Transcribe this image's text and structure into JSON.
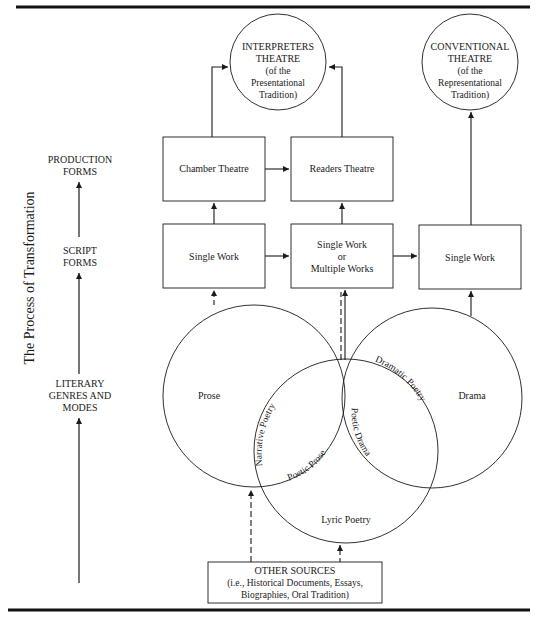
{
  "side_label": "The Process of Transformation",
  "levels": [
    {
      "line1": "PRODUCTION",
      "line2": "FORMS"
    },
    {
      "line1": "SCRIPT",
      "line2": "FORMS"
    },
    {
      "line1": "LITERARY",
      "line2": "GENRES AND",
      "line3": "MODES"
    }
  ],
  "top_circles": {
    "interpreters": {
      "line1": "INTERPRETERS",
      "line2": "THEATRE",
      "line3": "(of the",
      "line4": "Presentational",
      "line5": "Tradition)"
    },
    "conventional": {
      "line1": "CONVENTIONAL",
      "line2": "THEATRE",
      "line3": "(of the",
      "line4": "Representational",
      "line5": "Tradition)"
    }
  },
  "production_boxes": {
    "chamber": "Chamber Theatre",
    "readers": "Readers Theatre"
  },
  "script_boxes": {
    "left": "Single Work",
    "middle": {
      "line1": "Single Work",
      "line2": "or",
      "line3": "Multiple Works"
    },
    "right": "Single Work"
  },
  "genres": {
    "prose": "Prose",
    "drama": "Drama",
    "lyric": "Lyric Poetry",
    "narrative_poetry": "Narrative Poetry",
    "poetic_prose": "Poetic Prose",
    "dramatic_poetry": "Dramatic Poetry",
    "poetic_drama": "Poetic Drama"
  },
  "other_sources": {
    "line1": "OTHER SOURCES",
    "line2": "(i.e., Historical Documents, Essays,",
    "line3": "Biographies, Oral Tradition)"
  }
}
